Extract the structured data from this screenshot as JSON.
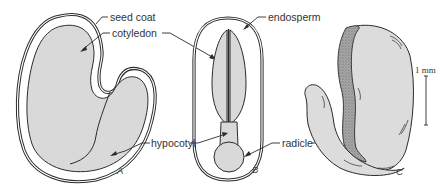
{
  "figure": {
    "colors": {
      "fill": "#d9d9d9",
      "stroke": "#2b2b2b",
      "coat_fill": "#9a9a9a",
      "text": "#333333"
    },
    "labels": {
      "seed_coat": "seed coat",
      "cotyledon": "cotyledon",
      "endosperm": "endosperm",
      "hypocotyl": "hypocotyl",
      "radicle": "radicle"
    },
    "panels": {
      "a": "A",
      "b": "B",
      "c": "C"
    },
    "scale_bar": {
      "label": "1 mm"
    }
  }
}
